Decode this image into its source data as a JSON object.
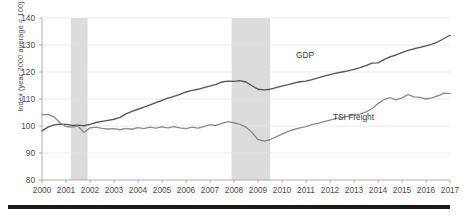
{
  "chart_data": {
    "type": "line",
    "title": "",
    "xlabel": "",
    "ylabel": "Index (year 2000 average = 100)",
    "ylim": [
      80,
      140
    ],
    "yticks": [
      80,
      90,
      100,
      110,
      120,
      130,
      140
    ],
    "xlim": [
      2000,
      2017.0
    ],
    "xticks": [
      2000,
      2001,
      2002,
      2003,
      2004,
      2005,
      2006,
      2007,
      2008,
      2009,
      2010,
      2011,
      2012,
      2013,
      2014,
      2015,
      2016,
      2017
    ],
    "xtick_labels": [
      "2000",
      "2001",
      "2002",
      "2003",
      "2004",
      "2005",
      "2006",
      "2007",
      "2008",
      "2009",
      "2010",
      "2011",
      "2012",
      "2013",
      "2014",
      "2015",
      "2016",
      "2017"
    ],
    "grid": "horizontal",
    "legend_position": "inline-annotations",
    "colors": {
      "gdp": "#55565a",
      "tsi_freight": "#8a8c90",
      "recession_band": "#dcdcdc",
      "gridline": "#e3e3e3",
      "axis": "#9a9a9a",
      "bottom_rule": "#1a1a1a"
    },
    "shaded_regions": [
      {
        "name": "recession-2001",
        "x0": 2001.2,
        "x1": 2001.9
      },
      {
        "name": "recession-2008-2009",
        "x0": 2007.9,
        "x1": 2009.5
      }
    ],
    "series": [
      {
        "name": "GDP",
        "color": "#55565a",
        "x": [
          2000.0,
          2000.25,
          2000.5,
          2000.75,
          2001.0,
          2001.25,
          2001.5,
          2001.75,
          2002.0,
          2002.25,
          2002.5,
          2002.75,
          2003.0,
          2003.25,
          2003.5,
          2003.75,
          2004.0,
          2004.25,
          2004.5,
          2004.75,
          2005.0,
          2005.25,
          2005.5,
          2005.75,
          2006.0,
          2006.25,
          2006.5,
          2006.75,
          2007.0,
          2007.25,
          2007.5,
          2007.75,
          2008.0,
          2008.25,
          2008.5,
          2008.75,
          2009.0,
          2009.25,
          2009.5,
          2009.75,
          2010.0,
          2010.25,
          2010.5,
          2010.75,
          2011.0,
          2011.25,
          2011.5,
          2011.75,
          2012.0,
          2012.25,
          2012.5,
          2012.75,
          2013.0,
          2013.25,
          2013.5,
          2013.75,
          2014.0,
          2014.25,
          2014.5,
          2014.75,
          2015.0,
          2015.25,
          2015.5,
          2015.75,
          2016.0,
          2016.25,
          2016.5,
          2016.75,
          2017.0
        ],
        "values": [
          98.2,
          99.6,
          100.4,
          100.7,
          100.6,
          100.2,
          100.3,
          100.1,
          100.6,
          101.3,
          101.7,
          102.1,
          102.5,
          103.2,
          104.5,
          105.4,
          106.2,
          107.0,
          107.8,
          108.7,
          109.5,
          110.3,
          111.0,
          111.7,
          112.6,
          113.2,
          113.6,
          114.2,
          114.8,
          115.4,
          116.3,
          116.6,
          116.5,
          116.8,
          116.3,
          114.9,
          113.6,
          113.4,
          113.6,
          114.2,
          114.8,
          115.3,
          115.9,
          116.4,
          116.6,
          117.2,
          117.8,
          118.5,
          119.0,
          119.6,
          120.0,
          120.4,
          121.0,
          121.6,
          122.4,
          123.3,
          123.4,
          124.6,
          125.6,
          126.3,
          127.2,
          128.0,
          128.6,
          129.1,
          129.7,
          130.3,
          131.2,
          132.4,
          133.6
        ]
      },
      {
        "name": "TSI Freight",
        "color": "#8a8c90",
        "x": [
          2000.0,
          2000.25,
          2000.5,
          2000.75,
          2001.0,
          2001.25,
          2001.5,
          2001.75,
          2002.0,
          2002.25,
          2002.5,
          2002.75,
          2003.0,
          2003.25,
          2003.5,
          2003.75,
          2004.0,
          2004.25,
          2004.5,
          2004.75,
          2005.0,
          2005.25,
          2005.5,
          2005.75,
          2006.0,
          2006.25,
          2006.5,
          2006.75,
          2007.0,
          2007.25,
          2007.5,
          2007.75,
          2008.0,
          2008.25,
          2008.5,
          2008.75,
          2009.0,
          2009.25,
          2009.5,
          2009.75,
          2010.0,
          2010.25,
          2010.5,
          2010.75,
          2011.0,
          2011.25,
          2011.5,
          2011.75,
          2012.0,
          2012.25,
          2012.5,
          2012.75,
          2013.0,
          2013.25,
          2013.5,
          2013.75,
          2014.0,
          2014.25,
          2014.5,
          2014.75,
          2015.0,
          2015.25,
          2015.5,
          2015.75,
          2016.0,
          2016.25,
          2016.5,
          2016.75,
          2017.0
        ],
        "values": [
          104.2,
          104.3,
          103.4,
          101.2,
          99.8,
          99.6,
          100.0,
          97.6,
          99.3,
          99.6,
          99.1,
          98.9,
          99.0,
          98.6,
          99.1,
          98.8,
          99.4,
          99.0,
          99.6,
          99.2,
          99.7,
          99.3,
          99.8,
          99.3,
          99.0,
          99.6,
          99.2,
          99.8,
          100.5,
          100.2,
          101.0,
          101.6,
          101.2,
          100.6,
          99.6,
          97.6,
          95.0,
          94.4,
          94.9,
          96.0,
          97.0,
          98.0,
          98.7,
          99.3,
          99.8,
          100.5,
          101.0,
          101.6,
          102.2,
          102.8,
          103.1,
          103.6,
          104.2,
          104.4,
          105.2,
          106.4,
          108.3,
          109.8,
          110.5,
          109.7,
          110.4,
          111.6,
          110.8,
          110.6,
          110.0,
          110.4,
          111.2,
          112.2,
          112.0
        ]
      }
    ]
  },
  "annotations": {
    "gdp_label": "GDP",
    "tsi_label": "TSI Freight"
  }
}
